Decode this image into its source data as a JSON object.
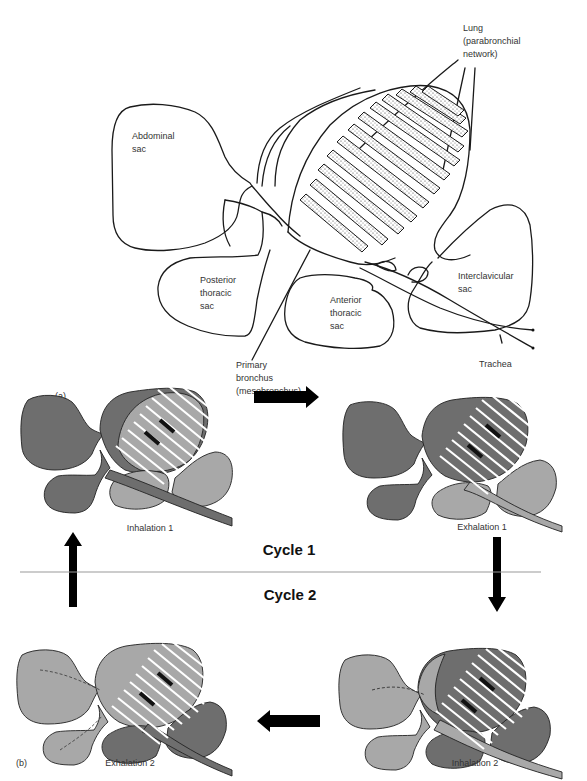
{
  "figure": {
    "panel_a": {
      "letter": "(a)",
      "labels": {
        "lung": "Lung\n(parabronchial\nnetwork)",
        "abdominal_sac": "Abdominal\nsac",
        "posterior_thoracic_sac": "Posterior\nthoracic\nsac",
        "anterior_thoracic_sac": "Anterior\nthoracic\nsac",
        "interclavicular_sac": "Interclavicular\nsac",
        "trachea": "Trachea",
        "primary_bronchus": "Primary\nbronchus\n(mesobronchus)"
      }
    },
    "panel_b": {
      "letter": "(b)",
      "cycle_1": "Cycle 1",
      "cycle_2": "Cycle 2",
      "stages": [
        {
          "label": "Inhalation 1",
          "posterior_shade": "dark",
          "anterior_shade": "light"
        },
        {
          "label": "Exhalation 1",
          "posterior_shade": "dark",
          "anterior_shade": "light"
        },
        {
          "label": "Inhalation 2",
          "posterior_shade": "light",
          "anterior_shade": "dark"
        },
        {
          "label": "Exhalation 2",
          "posterior_shade": "light",
          "anterior_shade": "dark"
        }
      ],
      "flow_arrows": [
        "right-arrow",
        "down-arrow",
        "left-arrow",
        "up-arrow"
      ]
    },
    "colors": {
      "dark_gray": "#6e6e6e",
      "light_gray": "#a8a8a8",
      "outline": "#222222"
    }
  }
}
